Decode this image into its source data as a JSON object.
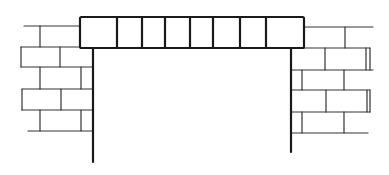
{
  "diagram": {
    "colors": {
      "stroke": "#1a1a1a",
      "background": "#ffffff"
    },
    "lintel": {
      "x": 80,
      "y": 17,
      "width": 224,
      "height": 31,
      "dividers": [
        117,
        142,
        165,
        190,
        213,
        240,
        266
      ]
    },
    "left_wall": {
      "jamb": {
        "x": 93,
        "y1": 47,
        "y2": 162
      },
      "courses": [
        {
          "y": 26,
          "x1": 24,
          "x2": 80,
          "joints": [
            40
          ]
        },
        {
          "y": 47,
          "x1": 21,
          "x2": 93,
          "joints": [
            60
          ],
          "left_cap": true
        },
        {
          "y": 67,
          "x1": 21,
          "x2": 93,
          "joints": [
            40,
            81
          ]
        },
        {
          "y": 89,
          "x1": 22,
          "x2": 93,
          "joints": [
            61
          ],
          "left_cap": true
        },
        {
          "y": 110,
          "x1": 22,
          "x2": 93,
          "joints": [
            40,
            81
          ]
        },
        {
          "y": 131,
          "x1": 28,
          "x2": 93,
          "joints": []
        }
      ]
    },
    "right_wall": {
      "jamb": {
        "x": 291,
        "y1": 48,
        "y2": 152
      },
      "courses": [
        {
          "y": 27,
          "x1": 304,
          "x2": 373,
          "joints": [
            345
          ]
        },
        {
          "y": 48,
          "x1": 291,
          "x2": 370,
          "joints": [
            325,
            366
          ]
        },
        {
          "y": 70,
          "x1": 291,
          "x2": 373,
          "joints": [
            302,
            344
          ]
        },
        {
          "y": 90,
          "x1": 291,
          "x2": 370,
          "joints": [
            326,
            367
          ]
        },
        {
          "y": 112,
          "x1": 291,
          "x2": 370,
          "joints": [
            302,
            344
          ]
        },
        {
          "y": 133,
          "x1": 291,
          "x2": 368,
          "joints": []
        }
      ]
    }
  }
}
